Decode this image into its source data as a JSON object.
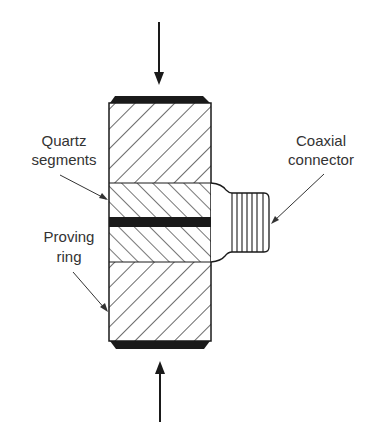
{
  "diagram": {
    "labels": {
      "quartz": {
        "line1": "Quartz",
        "line2": "segments"
      },
      "proving": {
        "line1": "Proving",
        "line2": "ring"
      },
      "coaxial": {
        "line1": "Coaxial",
        "line2": "connector"
      }
    },
    "arrows": [
      {
        "name": "applied-force-top",
        "direction": "down"
      },
      {
        "name": "applied-force-bottom",
        "direction": "up"
      }
    ],
    "colors": {
      "ink": "#1a1a1a",
      "text": "#333333",
      "background": "#ffffff"
    }
  }
}
